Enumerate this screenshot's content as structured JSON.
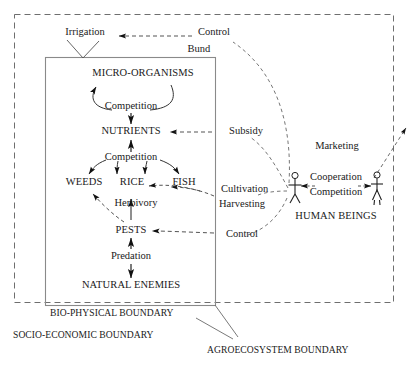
{
  "diagram": {
    "type": "concept-map",
    "colors": {
      "ink": "#1a1a1a",
      "solid_line": "#7a7a7a",
      "dashed_line": "#5a5a5a",
      "arrow": "#111111",
      "background": "#ffffff"
    }
  },
  "boundaries": {
    "socio_economic": "SOCIO-ECONOMIC BOUNDARY",
    "bio_physical": "BIO-PHYSICAL BOUNDARY",
    "agroecosystem": "AGROECOSYSTEM BOUNDARY"
  },
  "nodes": {
    "irrigation": "Irrigation",
    "bund": "Bund",
    "micro_organisms": "MICRO-ORGANISMS",
    "nutrients": "NUTRIENTS",
    "weeds": "WEEDS",
    "rice": "RICE",
    "fish": "FISH",
    "pests": "PESTS",
    "natural_enemies": "NATURAL ENEMIES",
    "human_beings": "HUMAN BEINGS"
  },
  "relations": {
    "competition_micro": "Competition",
    "competition_crop": "Competition",
    "herbivory": "Herbivory",
    "predation": "Predation",
    "control_top": "Control",
    "subsidy": "Subsidy",
    "cultivation": "Cultivation",
    "harvesting": "Harvesting",
    "control_pests": "Control",
    "marketing": "Marketing",
    "cooperation": "Cooperation",
    "competition_human": "Competition"
  },
  "figures": {
    "left_person": "male-stick-figure",
    "right_person": "female-stick-figure"
  },
  "icons": {
    "arrowhead": "solid-triangle-arrowhead",
    "dashed_link": "dashed-connector",
    "solid_link": "solid-connector"
  }
}
